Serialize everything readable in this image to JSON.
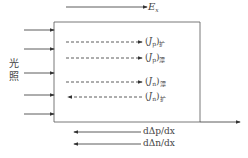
{
  "diagram": {
    "field_label": {
      "symbol": "E",
      "sub": "x"
    },
    "illumination_label": [
      "光",
      "照"
    ],
    "currents": [
      {
        "name": "J",
        "carrier": "p",
        "type": "扩",
        "direction": "right"
      },
      {
        "name": "J",
        "carrier": "p",
        "type": "漂",
        "direction": "right"
      },
      {
        "name": "J",
        "carrier": "n",
        "type": "漂",
        "direction": "right"
      },
      {
        "name": "J",
        "carrier": "n",
        "type": "扩",
        "direction": "left"
      }
    ],
    "gradients": [
      "dΔp/dx",
      "dΔn/dx"
    ],
    "incident_arrows": 5
  }
}
